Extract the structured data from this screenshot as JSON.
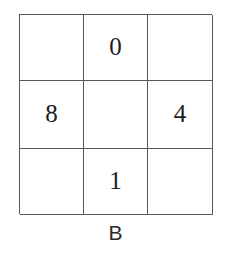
{
  "figure": {
    "label": "B",
    "type": "3x3-number-grid",
    "rows": 3,
    "cols": 3,
    "line_color": "#555a5e",
    "text_color": "#1d1d1f",
    "background": "#ffffff",
    "cells": [
      {
        "id": "r1c1",
        "row": 1,
        "col": 1,
        "value": "",
        "empty": true
      },
      {
        "id": "r1c2",
        "row": 1,
        "col": 2,
        "value": "0",
        "empty": false
      },
      {
        "id": "r1c3",
        "row": 1,
        "col": 3,
        "value": "",
        "empty": true
      },
      {
        "id": "r2c1",
        "row": 2,
        "col": 1,
        "value": "8",
        "empty": false
      },
      {
        "id": "r2c2",
        "row": 2,
        "col": 2,
        "value": "",
        "empty": true
      },
      {
        "id": "r2c3",
        "row": 2,
        "col": 3,
        "value": "4",
        "empty": false
      },
      {
        "id": "r3c1",
        "row": 3,
        "col": 1,
        "value": "",
        "empty": true
      },
      {
        "id": "r3c2",
        "row": 3,
        "col": 2,
        "value": "1",
        "empty": false
      },
      {
        "id": "r3c3",
        "row": 3,
        "col": 3,
        "value": "",
        "empty": true
      }
    ]
  }
}
